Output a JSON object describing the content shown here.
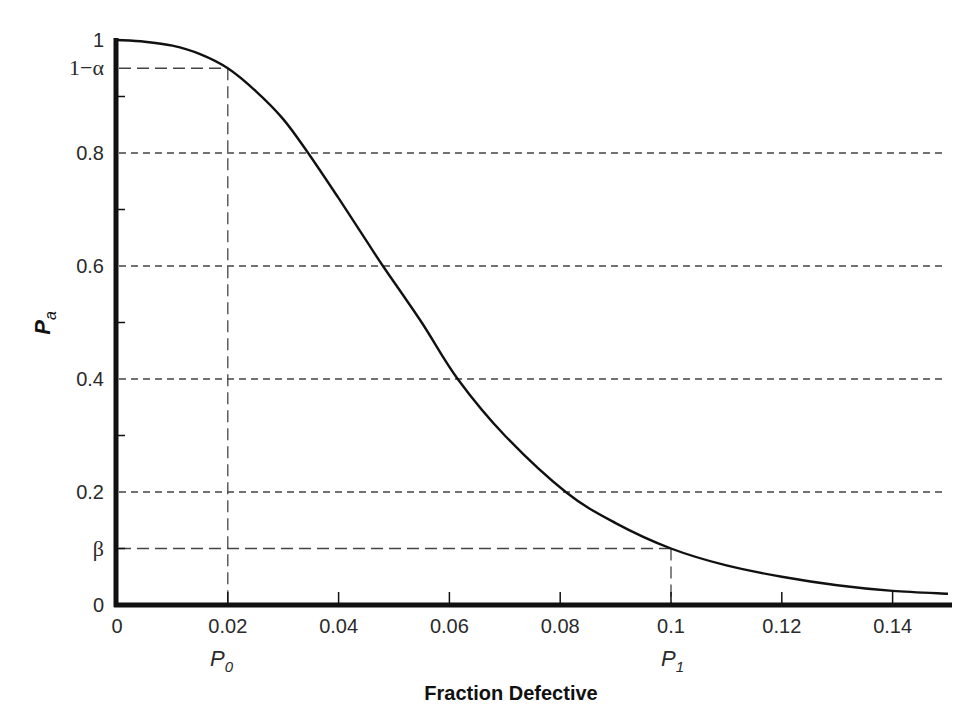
{
  "chart_data": {
    "type": "line",
    "title": "",
    "xlabel": "Fraction Defective",
    "ylabel": "P_a",
    "ylabel_main": "P",
    "ylabel_sub": "a",
    "xlim": [
      0,
      0.15
    ],
    "ylim": [
      0,
      1
    ],
    "x_ticks": [
      "0",
      "0.02",
      "0.04",
      "0.06",
      "0.08",
      "0.1",
      "0.12",
      "0.14"
    ],
    "y_ticks": [
      "0",
      "β",
      "0.2",
      "0.4",
      "0.6",
      "0.8",
      "1−α",
      "1"
    ],
    "grid": "dashed horizontal lines at 0.2, 0.4, 0.6, 0.8",
    "annotations": {
      "alpha_label": "1−α",
      "alpha_value": 0.95,
      "beta_label": "β",
      "beta_value": 0.1,
      "p0_label": "P",
      "p0_sub": "0",
      "p0_value": 0.02,
      "p1_label": "P",
      "p1_sub": "1",
      "p1_value": 0.1
    },
    "series": [
      {
        "name": "OC curve",
        "x": [
          0,
          0.005,
          0.01,
          0.015,
          0.02,
          0.025,
          0.03,
          0.0345,
          0.04,
          0.045,
          0.048,
          0.055,
          0.0615,
          0.07,
          0.081,
          0.09,
          0.1,
          0.11,
          0.12,
          0.13,
          0.14,
          0.15
        ],
        "values": [
          1.0,
          0.997,
          0.99,
          0.975,
          0.95,
          0.91,
          0.86,
          0.8,
          0.72,
          0.645,
          0.6,
          0.5,
          0.4,
          0.3,
          0.2,
          0.145,
          0.1,
          0.07,
          0.05,
          0.035,
          0.025,
          0.02
        ]
      }
    ],
    "x_tick_values": [
      0,
      0.02,
      0.04,
      0.06,
      0.08,
      0.1,
      0.12,
      0.14
    ],
    "gridline_values": [
      0.2,
      0.4,
      0.6,
      0.8
    ]
  }
}
